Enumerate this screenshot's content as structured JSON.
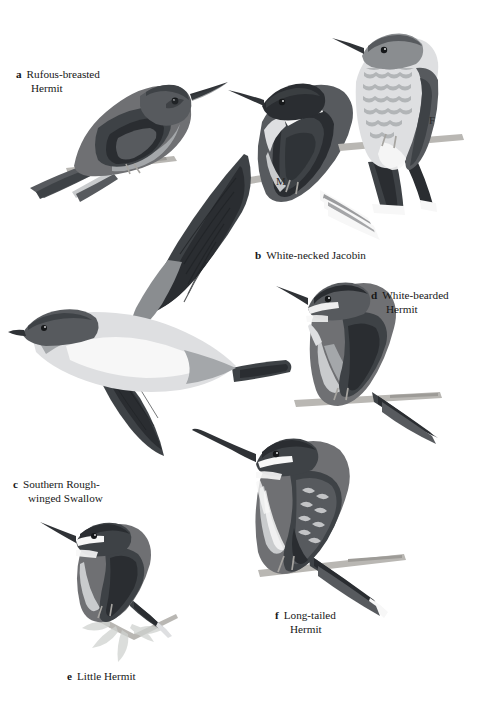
{
  "plate": {
    "type": "illustrated field guide plate",
    "background_color": "#ffffff",
    "ink_color": "#6f7073",
    "text_color": "#171717",
    "width": 490,
    "height": 709
  },
  "captions": [
    {
      "key": "a",
      "line1": "Rufous-breasted",
      "line2": "Hermit",
      "full": "Rufous-breasted Hermit"
    },
    {
      "key": "b",
      "line1": "White-necked Jacobin",
      "line2": "",
      "full": "White-necked Jacobin"
    },
    {
      "key": "c",
      "line1": "Southern Rough-",
      "line2": "winged Swallow",
      "full": "Southern Rough-winged Swallow"
    },
    {
      "key": "d",
      "line1": "White-bearded",
      "line2": "Hermit",
      "full": "White-bearded Hermit"
    },
    {
      "key": "e",
      "line1": "Little Hermit",
      "line2": "",
      "full": "Little Hermit"
    },
    {
      "key": "f",
      "line1": "Long-tailed",
      "line2": "Hermit",
      "full": "Long-tailed Hermit"
    }
  ],
  "sex_marks": [
    {
      "symbol": "M",
      "for": "White-necked Jacobin"
    },
    {
      "symbol": "F",
      "for": "White-necked Jacobin"
    }
  ],
  "figures": [
    {
      "id": "a",
      "name": "Rufous-breasted Hermit",
      "pose": "perched on twig, facing right, long decurved bill"
    },
    {
      "id": "b",
      "name": "White-necked Jacobin",
      "pose": "two birds perched on twig; male facing left with white neck band, female facing left with scaled underparts"
    },
    {
      "id": "c",
      "name": "Southern Rough-winged Swallow",
      "pose": "in flight, facing left, wings raised"
    },
    {
      "id": "d",
      "name": "White-bearded Hermit",
      "pose": "perched on twig, facing left, decurved bill"
    },
    {
      "id": "e",
      "name": "Little Hermit",
      "pose": "perched on leafy twig, facing left"
    },
    {
      "id": "f",
      "name": "Long-tailed Hermit",
      "pose": "perched on twig, facing left, long decurved bill"
    }
  ]
}
